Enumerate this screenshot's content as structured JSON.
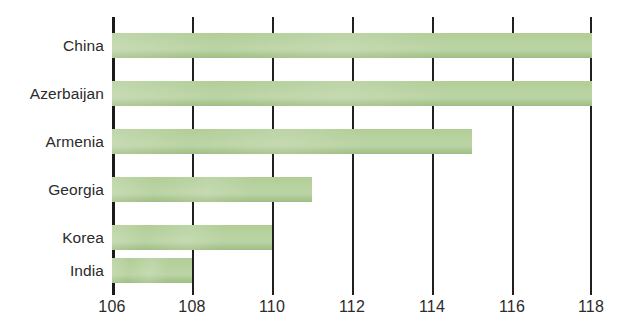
{
  "chart_data": {
    "type": "bar",
    "orientation": "horizontal",
    "title": "",
    "subtitle": "",
    "xlabel": "",
    "ylabel": "",
    "categories": [
      "China",
      "Azerbaijan",
      "Armenia",
      "Georgia",
      "Korea",
      "India"
    ],
    "values": [
      118,
      118,
      115,
      111,
      110,
      108
    ],
    "xlim": [
      106,
      118
    ],
    "xticks": [
      106,
      108,
      110,
      112,
      114,
      116,
      118
    ],
    "xtick_labels": [
      "106",
      "108",
      "110",
      "112",
      "114",
      "116",
      "118"
    ],
    "grid": "vertical",
    "legend": "none",
    "annotations": [],
    "series": [
      {
        "name": "",
        "values": [
          118,
          118,
          115,
          111,
          110,
          108
        ]
      }
    ]
  },
  "style": {
    "bar_color": "#a9c88c",
    "axis_color": "#231f20",
    "text_color": "#2b2b2b",
    "background": "#ffffff"
  }
}
